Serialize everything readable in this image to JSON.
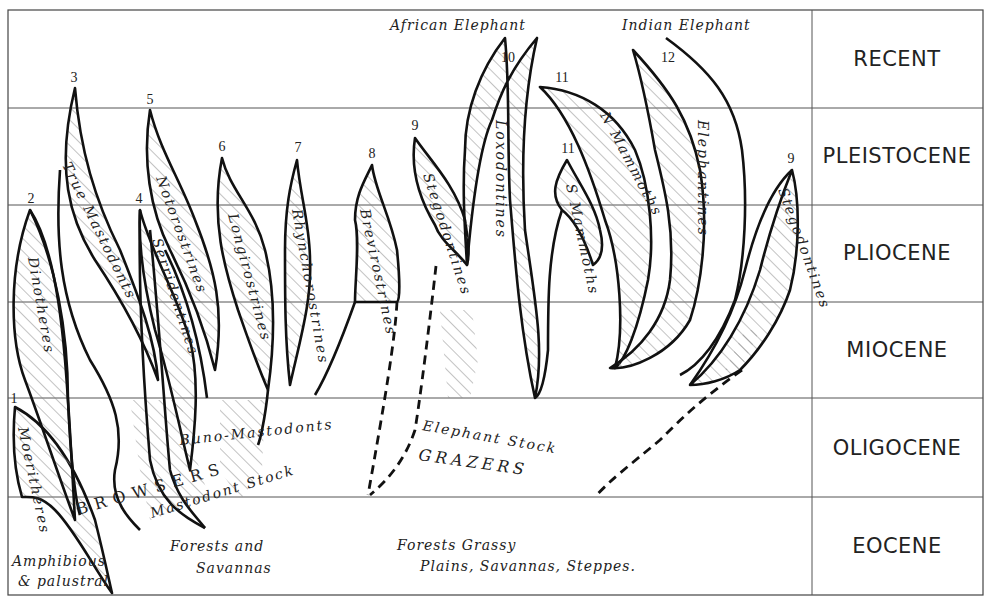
{
  "epochs": [
    {
      "name": "RECENT"
    },
    {
      "name": "PLEISTOCENE"
    },
    {
      "name": "PLIOCENE"
    },
    {
      "name": "MIOCENE"
    },
    {
      "name": "OLIGOCENE"
    },
    {
      "name": "EOCENE"
    }
  ],
  "living_species": {
    "african": "African Elephant",
    "indian": "Indian Elephant"
  },
  "branches": [
    {
      "number": "1",
      "name": "Moeritheres"
    },
    {
      "number": "2",
      "name": "Dinotheres"
    },
    {
      "number": "3",
      "name": "True Mastodonts"
    },
    {
      "number": "4",
      "name": "Serridentines"
    },
    {
      "number": "5",
      "name": "Notorostrines"
    },
    {
      "number": "6",
      "name": "Longirostrines"
    },
    {
      "number": "7",
      "name": "Rhynchorostrines"
    },
    {
      "number": "8",
      "name": "Brevirostrines"
    },
    {
      "number": "9",
      "name": "Stegodontines"
    },
    {
      "number": "10",
      "name": "Loxodontines"
    },
    {
      "number": "11",
      "name": "N Mammoths"
    },
    {
      "number": "11",
      "name": "S Mammoths"
    },
    {
      "number": "12",
      "name": "Elephantines"
    },
    {
      "number": "9",
      "name": "Stegodontines"
    }
  ],
  "stock_labels": {
    "buno_mastodonts": "Buno-Mastodonts",
    "mastodont_stock": "Mastodont Stock",
    "elephant_stock": "Elephant Stock",
    "browsers": "BROWSERS",
    "grazers": "GRAZERS"
  },
  "habitats": {
    "amphibious_line1": "Amphibious",
    "amphibious_line2": "& palustral",
    "forests_line1": "Forests and",
    "forests_line2": "Savannas",
    "grassy_line1": "Forests Grassy",
    "grassy_line2": "Plains, Savannas, Steppes."
  }
}
